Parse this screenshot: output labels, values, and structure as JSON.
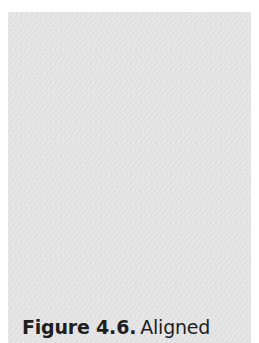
{
  "figure": {
    "panel_color": "#e3e3e3",
    "caption": {
      "label": "Figure 4.6.",
      "text": "Aligned"
    }
  }
}
